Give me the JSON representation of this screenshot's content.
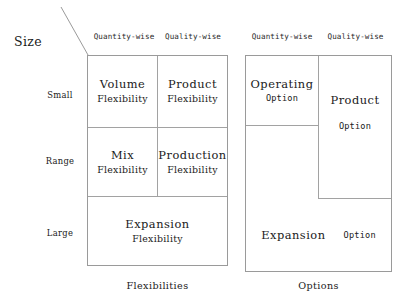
{
  "diagram": {
    "axis_label": "Size",
    "columns": [
      {
        "id": "quantity-wise",
        "label": "Quantity-wise"
      },
      {
        "id": "quality-wise",
        "label": "Quality-wise"
      }
    ],
    "rows": [
      {
        "id": "small",
        "label": "Small"
      },
      {
        "id": "range",
        "label": "Range"
      },
      {
        "id": "large",
        "label": "Large"
      }
    ],
    "left_table": {
      "caption": "Flexibilities",
      "cells": {
        "small_quantity": {
          "line1": "Volume",
          "line2": "Flexibility"
        },
        "small_quality": {
          "line1": "Product",
          "line2": "Flexibility"
        },
        "range_quantity": {
          "line1": "Mix",
          "line2": "Flexibility"
        },
        "range_quality": {
          "line1": "Production",
          "line2": "Flexibility"
        },
        "large_span": {
          "line1": "Expansion",
          "line2": "Flexibility"
        }
      }
    },
    "right_table": {
      "caption": "Options",
      "cells": {
        "operating": {
          "line1": "Operating",
          "line2": "Option"
        },
        "product": {
          "line1": "Product",
          "line2": "Option"
        },
        "expansion": {
          "line1": "Expansion",
          "line2": "Option"
        }
      }
    },
    "colors": {
      "border": "#9a9a9a",
      "divider": "#a2a2a2",
      "text": "#1a1a1a",
      "background": "#ffffff"
    }
  }
}
